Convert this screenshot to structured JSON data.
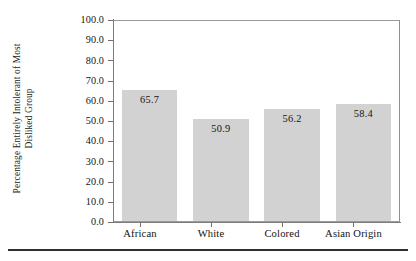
{
  "chart_data": {
    "type": "bar",
    "title": "",
    "xlabel": "",
    "ylabel_line1": "Percentage Entirely Intolerant of Most",
    "ylabel_line2": "Disliked Group",
    "categories": [
      "African",
      "White",
      "Colored",
      "Asian Origin"
    ],
    "values": [
      65.7,
      50.9,
      56.2,
      58.4
    ],
    "value_labels": [
      "65.7",
      "50.9",
      "56.2",
      "58.4"
    ],
    "ylim": [
      0.0,
      100.0
    ],
    "ytick_values": [
      100.0,
      90.0,
      80.0,
      70.0,
      60.0,
      50.0,
      40.0,
      30.0,
      20.0,
      10.0,
      0.0
    ],
    "ytick_labels": [
      "100.0",
      "90.0",
      "80.0",
      "70.0",
      "60.0",
      "50.0",
      "40.0",
      "30.0",
      "20.0",
      "10.0",
      "0.0"
    ],
    "grid": false,
    "legend": false,
    "legend_position": "none",
    "bar_color": "#d2d2d2",
    "frame_color": "#9a9a9a",
    "text_color": "#141414"
  }
}
